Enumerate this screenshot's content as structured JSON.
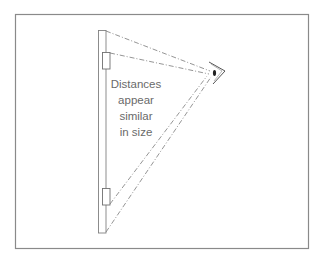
{
  "figure": {
    "caption_lines": [
      "Distances",
      "appear",
      "similar",
      "in size"
    ],
    "colors": {
      "frame": "#8a8a8a",
      "lines": "#7a7a7a",
      "text": "#6a6a6a",
      "background": "#ffffff"
    },
    "elements": {
      "wall_bar": "vertical-bar",
      "upper_object": "upper-rectangle",
      "lower_object": "lower-rectangle",
      "viewer": "eye-icon"
    }
  }
}
